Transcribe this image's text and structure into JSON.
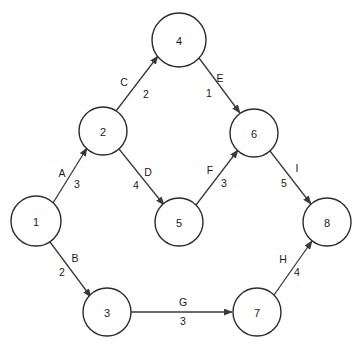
{
  "diagram": {
    "type": "directed-weighted-graph",
    "width": 363,
    "height": 351,
    "background_color": "#ffffff",
    "node_stroke_color": "#2b2b2b",
    "edge_stroke_color": "#3a3a3a",
    "text_color": "#1a1a1a",
    "nodes": [
      {
        "id": "1",
        "label": "1",
        "cx": 36,
        "cy": 221,
        "r": 25
      },
      {
        "id": "2",
        "label": "2",
        "cx": 103,
        "cy": 131,
        "r": 24
      },
      {
        "id": "3",
        "label": "3",
        "cx": 107,
        "cy": 312,
        "r": 24
      },
      {
        "id": "4",
        "label": "4",
        "cx": 179,
        "cy": 40,
        "r": 27
      },
      {
        "id": "5",
        "label": "5",
        "cx": 179,
        "cy": 222,
        "r": 24
      },
      {
        "id": "6",
        "label": "6",
        "cx": 254,
        "cy": 133,
        "r": 24
      },
      {
        "id": "7",
        "label": "7",
        "cx": 257,
        "cy": 312,
        "r": 24
      },
      {
        "id": "8",
        "label": "8",
        "cx": 327,
        "cy": 222,
        "r": 24
      }
    ],
    "edges": [
      {
        "id": "A",
        "name": "A",
        "weight": "3",
        "from": "1",
        "to": "2",
        "x1": 53,
        "y1": 203,
        "x2": 87,
        "y2": 148,
        "name_x": 62,
        "name_y": 173,
        "weight_x": 77,
        "weight_y": 184
      },
      {
        "id": "B",
        "name": "B",
        "weight": "2",
        "from": "1",
        "to": "3",
        "x1": 50,
        "y1": 242,
        "x2": 91,
        "y2": 297,
        "name_x": 75,
        "name_y": 258,
        "weight_x": 62,
        "weight_y": 272
      },
      {
        "id": "C",
        "name": "C",
        "weight": "2",
        "from": "2",
        "to": "4",
        "x1": 116,
        "y1": 111,
        "x2": 158,
        "y2": 56,
        "name_x": 124,
        "name_y": 82,
        "weight_x": 146,
        "weight_y": 94
      },
      {
        "id": "D",
        "name": "D",
        "weight": "4",
        "from": "2",
        "to": "5",
        "x1": 119,
        "y1": 149,
        "x2": 164,
        "y2": 205,
        "name_x": 148,
        "name_y": 172,
        "weight_x": 136,
        "weight_y": 185
      },
      {
        "id": "E",
        "name": "E",
        "weight": "1",
        "from": "4",
        "to": "6",
        "x1": 199,
        "y1": 58,
        "x2": 240,
        "y2": 113,
        "name_x": 220,
        "name_y": 78,
        "weight_x": 209,
        "weight_y": 93
      },
      {
        "id": "F",
        "name": "F",
        "weight": "3",
        "from": "5",
        "to": "6",
        "x1": 196,
        "y1": 205,
        "x2": 238,
        "y2": 150,
        "name_x": 210,
        "name_y": 170,
        "weight_x": 224,
        "weight_y": 183
      },
      {
        "id": "G",
        "name": "G",
        "weight": "3",
        "from": "3",
        "to": "7",
        "x1": 131,
        "y1": 312,
        "x2": 232,
        "y2": 312,
        "name_x": 183,
        "name_y": 302,
        "weight_x": 183,
        "weight_y": 321
      },
      {
        "id": "H",
        "name": "H",
        "weight": "4",
        "from": "7",
        "to": "8",
        "x1": 274,
        "y1": 295,
        "x2": 312,
        "y2": 241,
        "name_x": 283,
        "name_y": 259,
        "weight_x": 297,
        "weight_y": 272
      },
      {
        "id": "I",
        "name": "I",
        "weight": "5",
        "from": "6",
        "to": "8",
        "x1": 270,
        "y1": 151,
        "x2": 311,
        "y2": 204,
        "name_x": 297,
        "name_y": 168,
        "weight_x": 284,
        "weight_y": 183
      }
    ]
  }
}
